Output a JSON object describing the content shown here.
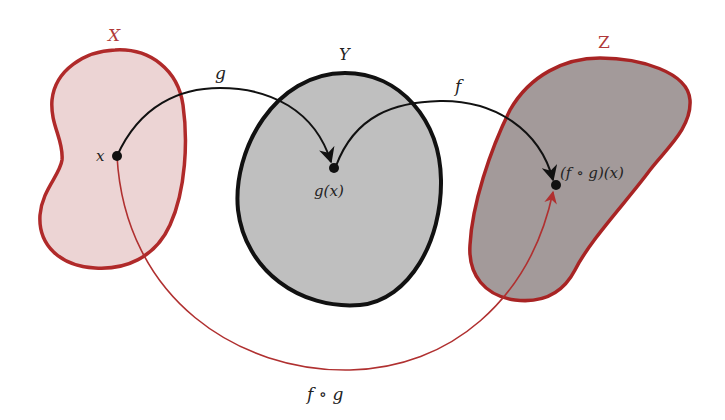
{
  "diagram": {
    "colors": {
      "set_x_fill": "#ecd4d4",
      "set_x_stroke": "#b02a2a",
      "set_y_fill": "#bfbfbf",
      "set_y_stroke": "#111111",
      "set_z_fill": "#a39a9a",
      "set_z_stroke": "#a82424",
      "arrow_black": "#111111",
      "arrow_red": "#b03030"
    },
    "sets": [
      {
        "id": "X",
        "label": "X"
      },
      {
        "id": "Y",
        "label": "Y"
      },
      {
        "id": "Z",
        "label": "Z"
      }
    ],
    "points": [
      {
        "id": "x",
        "label": "x"
      },
      {
        "id": "gx",
        "label": "g(x)"
      },
      {
        "id": "fgx",
        "label": "(f ∘ g)(x)"
      }
    ],
    "maps": [
      {
        "id": "g",
        "label": "g",
        "from": "x",
        "to": "gx"
      },
      {
        "id": "f",
        "label": "f",
        "from": "gx",
        "to": "fgx"
      },
      {
        "id": "fog",
        "label": "f ∘ g",
        "from": "x",
        "to": "fgx"
      }
    ]
  }
}
